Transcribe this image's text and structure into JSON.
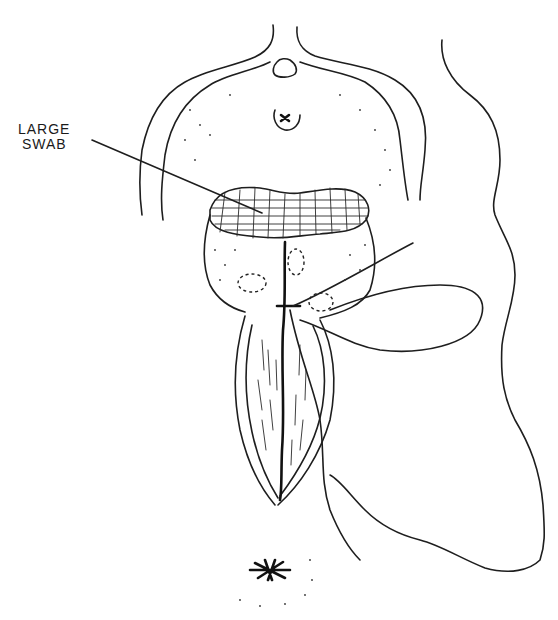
{
  "figure": {
    "type": "surgical line illustration",
    "annotations": [
      {
        "id": "large-swab",
        "line1": "LARGE",
        "line2": "SWAB"
      }
    ]
  }
}
